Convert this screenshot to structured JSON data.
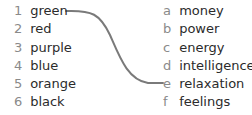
{
  "exercise": {
    "left_items": [
      {
        "key": "1",
        "label": "green"
      },
      {
        "key": "2",
        "label": "red"
      },
      {
        "key": "3",
        "label": "purple"
      },
      {
        "key": "4",
        "label": "blue"
      },
      {
        "key": "5",
        "label": "orange"
      },
      {
        "key": "6",
        "label": "black"
      }
    ],
    "right_items": [
      {
        "key": "a",
        "label": "money"
      },
      {
        "key": "b",
        "label": "power"
      },
      {
        "key": "c",
        "label": "energy"
      },
      {
        "key": "d",
        "label": "intelligence"
      },
      {
        "key": "e",
        "label": "relaxation"
      },
      {
        "key": "f",
        "label": "feelings"
      }
    ],
    "connections": [
      {
        "from": "1",
        "to": "e",
        "color": "#7a7a7a"
      }
    ]
  }
}
